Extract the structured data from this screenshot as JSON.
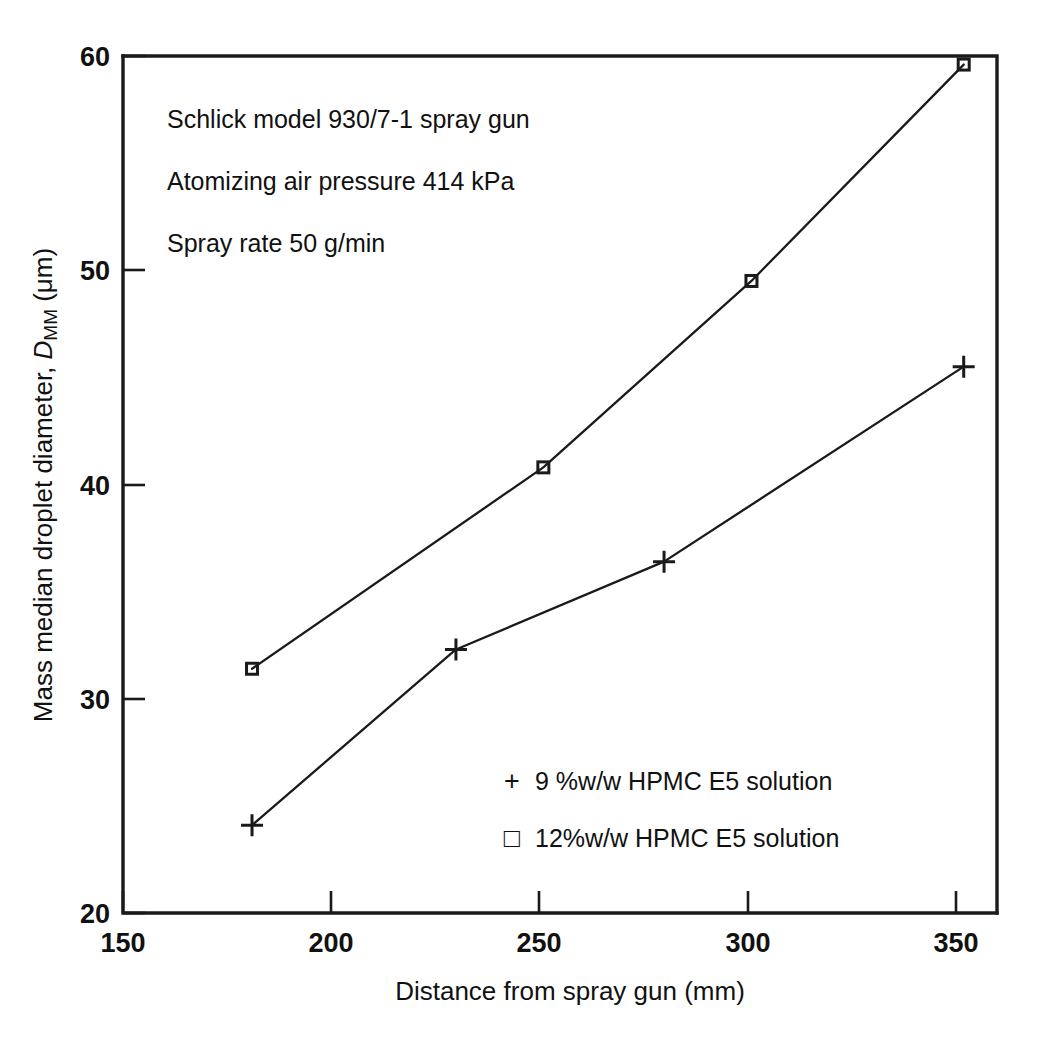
{
  "chart_data": {
    "type": "line",
    "title": "",
    "xlabel": "Distance from spray gun (mm)",
    "ylabel": "Mass median droplet diameter, D_MM (μm)",
    "ylabel_parts": {
      "prefix": "Mass median droplet diameter, ",
      "symbol": "D",
      "subscript": "MM",
      "suffix": " (μm)"
    },
    "xlim": [
      150,
      360
    ],
    "ylim": [
      20,
      60
    ],
    "xticks": [
      150,
      200,
      250,
      300,
      350
    ],
    "yticks": [
      20,
      30,
      40,
      50,
      60
    ],
    "xtick_labels": [
      "150",
      "200",
      "250",
      "300",
      "350"
    ],
    "ytick_labels": [
      "20",
      "30",
      "40",
      "50",
      "60"
    ],
    "grid": false,
    "legend_position": "inside-lower-right",
    "series": [
      {
        "name": "9 %w/w HPMC E5 solution",
        "marker": "plus",
        "x": [
          181,
          230,
          280,
          352
        ],
        "values": [
          24.1,
          32.3,
          36.4,
          45.5
        ]
      },
      {
        "name": "12%w/w HPMC E5 solution",
        "marker": "square",
        "x": [
          181,
          251,
          301,
          352
        ],
        "values": [
          31.4,
          40.8,
          49.5,
          59.6
        ]
      }
    ],
    "annotations": [
      "Schlick model 930/7-1 spray gun",
      "Atomizing air pressure 414 kPa",
      "Spray rate 50 g/min"
    ],
    "legend": [
      {
        "glyph": "+",
        "label": "9 %w/w HPMC E5 solution"
      },
      {
        "glyph": "□",
        "label": "12%w/w HPMC E5 solution"
      }
    ],
    "colors": {
      "ink": "#1a1a1a",
      "background": "#ffffff"
    }
  }
}
